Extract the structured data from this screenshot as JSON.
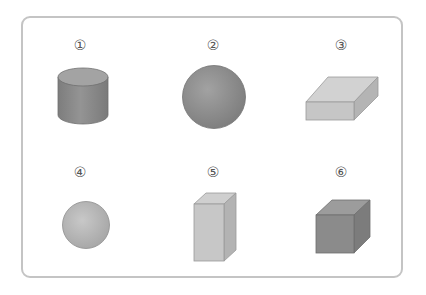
{
  "figure": {
    "items": [
      {
        "label": "①",
        "shape": "cylinder"
      },
      {
        "label": "②",
        "shape": "sphere-large"
      },
      {
        "label": "③",
        "shape": "flat-rectangular-prism"
      },
      {
        "label": "④",
        "shape": "sphere-small"
      },
      {
        "label": "⑤",
        "shape": "tall-rectangular-prism"
      },
      {
        "label": "⑥",
        "shape": "cube"
      }
    ],
    "colors": {
      "border": "#c4c4c4",
      "cylinder": "#8e8e8e",
      "sphere_large": "#8f8f8f",
      "flat_prism": "#cfcfcf",
      "sphere_small": "#bdbdbd",
      "tall_prism": "#c8c8c8",
      "cube": "#8a8a8a"
    }
  }
}
